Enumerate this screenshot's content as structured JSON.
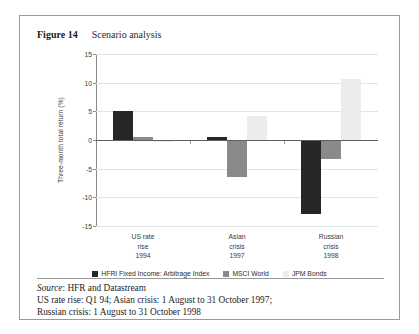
{
  "figure": {
    "number": "Figure 14",
    "title": "Scenario analysis"
  },
  "axis": {
    "ylabel": "Three-month total return (%)",
    "yticks": [
      "15",
      "10",
      "5",
      "0",
      "-5",
      "-10",
      "-15"
    ]
  },
  "legend": {
    "items": [
      {
        "label": "HFRI Fixed Income: Arbitrage Index",
        "color": "#262626"
      },
      {
        "label": "MSCI World",
        "color": "#8a8a8a"
      },
      {
        "label": "JPM Bonds",
        "color": "#ececec"
      }
    ]
  },
  "categories": [
    {
      "line1": "US rate",
      "line2": "rise",
      "line3": "1994"
    },
    {
      "line1": "Asian",
      "line2": "crisis",
      "line3": "1997"
    },
    {
      "line1": "Russian",
      "line2": "crisis",
      "line3": "1998"
    }
  ],
  "notes": {
    "source_word": "Source",
    "source_rest": ": HFR and Datastream",
    "line2": "US rate rise: Q1 94; Asian crisis: 1 August to 31 October 1997;",
    "line3": "Russian crisis: 1 August to 31 October 1998"
  },
  "chart_data": {
    "type": "bar",
    "title": "Scenario analysis",
    "xlabel": "",
    "ylabel": "Three-month total return (%)",
    "ylim": [
      -15,
      15
    ],
    "ytick_step": 5,
    "grid": true,
    "legend_position": "bottom",
    "categories": [
      "US rate rise 1994",
      "Asian crisis 1997",
      "Russian crisis 1998"
    ],
    "series": [
      {
        "name": "HFRI Fixed Income: Arbitrage Index",
        "color": "#262626",
        "values": [
          5.0,
          0.6,
          -12.9
        ]
      },
      {
        "name": "MSCI World",
        "color": "#8a8a8a",
        "values": [
          0.6,
          -6.5,
          -3.4
        ]
      },
      {
        "name": "JPM Bonds",
        "color": "#ececec",
        "values": [
          -0.3,
          4.2,
          10.7
        ]
      }
    ]
  }
}
